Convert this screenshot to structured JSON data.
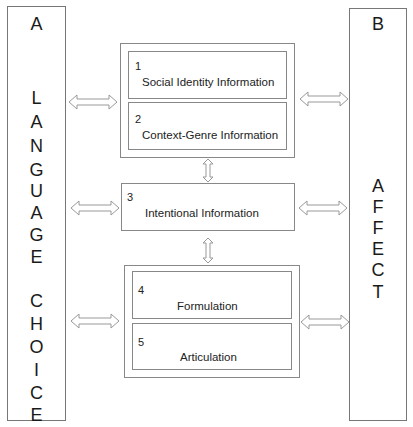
{
  "left_column": {
    "header": "A",
    "letters": [
      "L",
      "A",
      "N",
      "G",
      "U",
      "A",
      "G",
      "E",
      " ",
      "C",
      "H",
      "O",
      "I",
      "C",
      "E"
    ],
    "title": "LANGUAGE CHOICE"
  },
  "right_column": {
    "header": "B",
    "letters": [
      "A",
      "F",
      "F",
      "E",
      "C",
      "T"
    ],
    "title": "AFFECT"
  },
  "boxes": [
    {
      "num": "1",
      "label": "Social Identity Information"
    },
    {
      "num": "2",
      "label": "Context-Genre Information"
    },
    {
      "num": "3",
      "label": "Intentional Information"
    },
    {
      "num": "4",
      "label": "Formulation"
    },
    {
      "num": "5",
      "label": "Articulation"
    }
  ],
  "colors": {
    "border": "#888888",
    "text": "#222222",
    "arrow": "#999999"
  }
}
